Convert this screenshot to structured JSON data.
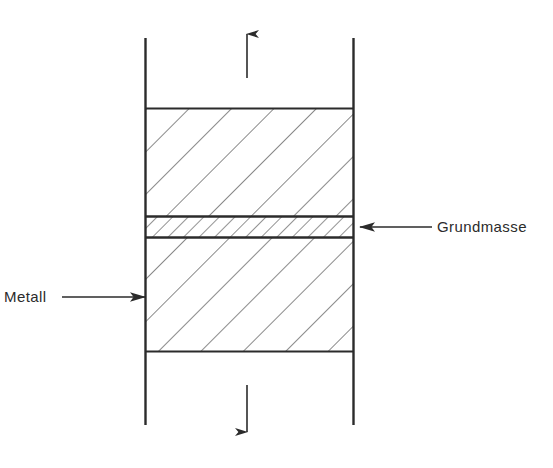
{
  "figure": {
    "type": "technical-line-diagram",
    "title": "",
    "background_color": "#ffffff",
    "line_color": "#2b2b2b",
    "hatch_color": "#4a4a4a",
    "width": 553,
    "height": 468
  },
  "labels": {
    "grundmasse": {
      "text": "Grundmasse",
      "x": 437,
      "y": 219,
      "font_size": 15,
      "color": "#2b2b2b"
    },
    "metall": {
      "text": "Metall",
      "x": 4,
      "y": 289,
      "font_size": 15,
      "color": "#2b2b2b"
    }
  },
  "geometry": {
    "left_rail_x": 145,
    "right_rail_x": 354,
    "rail_top_y": 38,
    "rail_bottom_y": 425,
    "specimen_top_y": 108,
    "specimen_bottom_y": 352,
    "band_top_y": 216,
    "band_bottom_y": 238,
    "hatch_angle_deg": 45,
    "hatch_spacing_main": 30,
    "hatch_spacing_band": 11
  },
  "arrows": {
    "load_up": {
      "name": "tensile-load-up",
      "x": 247,
      "y_tail": 78,
      "y_head": 28,
      "direction": "up"
    },
    "load_down": {
      "name": "tensile-load-down",
      "x": 247,
      "y_tail": 385,
      "y_head": 440,
      "direction": "down"
    },
    "leader_metall": {
      "name": "metall-leader",
      "y": 297,
      "x_tail": 62,
      "x_head": 145,
      "direction": "right"
    },
    "leader_grundmasse": {
      "name": "grundmasse-leader",
      "y": 227,
      "x_tail": 432,
      "x_head": 360,
      "direction": "left"
    }
  },
  "regions": [
    {
      "name": "upper-metal-block",
      "label_ref": "metall",
      "fill": "hatched-coarse"
    },
    {
      "name": "grundmasse-band",
      "label_ref": "grundmasse",
      "fill": "hatched-fine"
    },
    {
      "name": "lower-metal-block",
      "label_ref": "metall",
      "fill": "hatched-coarse"
    }
  ]
}
